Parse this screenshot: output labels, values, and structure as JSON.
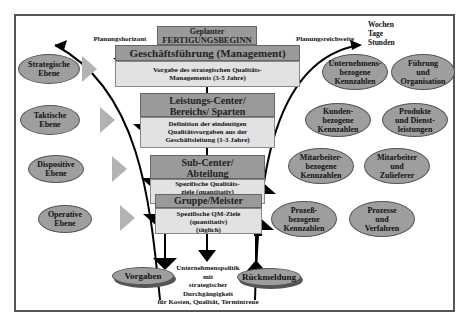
{
  "top_box": {
    "line1": "Geplanter",
    "line2": "FERTIGUNGSBEGINN"
  },
  "labels": {
    "left_arrow": "Planungshorizont",
    "right_arrow": "Planungsreichweite",
    "time_units": [
      "Wochen",
      "Tage",
      "Stunden"
    ]
  },
  "levels": [
    {
      "header": [
        "Geschäftsführung (Management)"
      ],
      "body": [
        "Vorgabe des strategischen Qualitäts-",
        "Managements (3-5 Jahre)"
      ]
    },
    {
      "header": [
        "Leistungs-Center/",
        "Bereichs/ Sparten"
      ],
      "body": [
        "Definition der eindeutigen",
        "Qualitätsvorgaben aus der",
        "Geschäftsleitung (1-3 Jahre)"
      ]
    },
    {
      "header": [
        "Sub-Center/",
        "Abteilung"
      ],
      "body": [
        "Spezifische Qualitäts-",
        "ziele (quantitativ)",
        "(wöchentlich/monatlich)"
      ]
    },
    {
      "header": [
        "Gruppe/Meister"
      ],
      "body": [
        "Spezifische QM-Ziele",
        "(quantitativ)",
        "(täglich)"
      ]
    }
  ],
  "left_ovals": [
    [
      "Strategische",
      "Ebene"
    ],
    [
      "Taktische",
      "Ebene"
    ],
    [
      "Dispositive",
      "Ebene"
    ],
    [
      "Operative",
      "Ebene"
    ]
  ],
  "kpi_ovals": [
    [
      "Unternehmens-",
      "bezogene",
      "Kennzahlen"
    ],
    [
      "Kunden-",
      "bezogene",
      "Kennzahlen"
    ],
    [
      "Mitarbeiter-",
      "bezogene",
      "Kennzahlen"
    ],
    [
      "Prozeß-",
      "bezogene",
      "Kennzahlen"
    ]
  ],
  "area_ovals": [
    [
      "Führung",
      "und",
      "Organisation"
    ],
    [
      "Produkte",
      "und Dienst-",
      "leistungen"
    ],
    [
      "Mitarbeiter",
      "und",
      "Zulieferer"
    ],
    [
      "Prozesse",
      "und",
      "Verfahren"
    ]
  ],
  "bottom": {
    "vorgaben": "Vorgaben",
    "rueckmeldung": "Rückmeldung",
    "policy": [
      "Unternehmenspolitik",
      "mit",
      "strategischer",
      "Durchgängigkeit",
      "für Kosten, Qualität, Termintreue"
    ]
  }
}
